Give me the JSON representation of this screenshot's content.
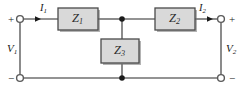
{
  "figure": {
    "name": "two-port-t-network",
    "background_color": "#ffffff",
    "wire_color": "#6f6f6f",
    "box_fill_color": "#d9d9d9",
    "box_border_color": "#4a4a4a",
    "text_color": "#1a1a1a",
    "width": 241,
    "height": 96
  },
  "impedances": {
    "z1": {
      "symbol": "Z",
      "subscript": "1"
    },
    "z2": {
      "symbol": "Z",
      "subscript": "2"
    },
    "z3": {
      "symbol": "Z",
      "subscript": "3"
    }
  },
  "currents": {
    "i1": {
      "symbol": "I",
      "subscript": "1"
    },
    "i2": {
      "symbol": "I",
      "subscript": "2"
    }
  },
  "voltages": {
    "v1": {
      "symbol": "V",
      "subscript": "1"
    },
    "v2": {
      "symbol": "V",
      "subscript": "2"
    }
  },
  "polarity": {
    "left_top": "+",
    "left_bottom": "−",
    "right_top": "+",
    "right_bottom": "−"
  }
}
